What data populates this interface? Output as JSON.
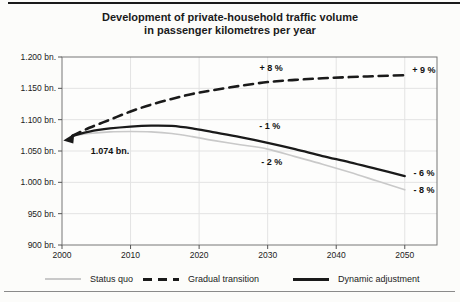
{
  "chart": {
    "title_line1": "Development of private-household traffic volume",
    "title_line2": "in passenger kilometres per year"
  },
  "chart_data": {
    "type": "line",
    "title": "Development of private-household traffic volume in passenger kilometres per year",
    "xlabel": "",
    "ylabel": "",
    "xlim": [
      2000,
      2054.7
    ],
    "ylim": [
      900,
      1200
    ],
    "grid": true,
    "legend_position": "bottom",
    "x_ticks": [
      2000,
      2010,
      2020,
      2030,
      2040,
      2050
    ],
    "x_tick_labels": [
      "2000",
      "2010",
      "2020",
      "2030",
      "2040",
      "2050"
    ],
    "y_ticks": [
      900,
      950,
      1000,
      1050,
      1100,
      1150,
      1200
    ],
    "y_tick_labels": [
      "900 bn.",
      "950 bn.",
      "1.000 bn.",
      "1.050 bn.",
      "1.100 bn.",
      "1.150 bn.",
      "1.200 bn."
    ],
    "colors": {
      "status_quo": "#c9c9c9",
      "gradual_transition": "#1a1a1a",
      "dynamic_adjustment": "#1a1a1a",
      "gridline": "#e3e3e3",
      "plot_border": "#777777"
    },
    "series": [
      {
        "name": "Status quo",
        "key": "status-quo",
        "color": "#c9c9c9",
        "width": 1.6,
        "dash": "",
        "points": [
          [
            2001.5,
            1074
          ],
          [
            2004,
            1078
          ],
          [
            2007,
            1080.5
          ],
          [
            2010,
            1081
          ],
          [
            2013,
            1080.5
          ],
          [
            2016,
            1078
          ],
          [
            2019,
            1073
          ],
          [
            2022,
            1067
          ],
          [
            2026,
            1060
          ],
          [
            2030,
            1053
          ],
          [
            2034,
            1041
          ],
          [
            2038,
            1029
          ],
          [
            2042,
            1016
          ],
          [
            2046,
            1002
          ],
          [
            2050,
            988
          ]
        ]
      },
      {
        "name": "Gradual transition",
        "key": "gradual-transition",
        "color": "#1a1a1a",
        "width": 2.6,
        "dash": "9 6",
        "points": [
          [
            2001.5,
            1074
          ],
          [
            2004,
            1087
          ],
          [
            2007,
            1100
          ],
          [
            2010,
            1113
          ],
          [
            2013,
            1124
          ],
          [
            2016,
            1133
          ],
          [
            2019,
            1141
          ],
          [
            2022,
            1147
          ],
          [
            2026,
            1154
          ],
          [
            2030,
            1160
          ],
          [
            2034,
            1163.5
          ],
          [
            2038,
            1166
          ],
          [
            2042,
            1168
          ],
          [
            2046,
            1169.5
          ],
          [
            2050,
            1171
          ]
        ]
      },
      {
        "name": "Dynamic adjustment",
        "key": "dynamic-adjustment",
        "color": "#1a1a1a",
        "width": 2.3,
        "dash": "",
        "points": [
          [
            2001.5,
            1074
          ],
          [
            2004,
            1081
          ],
          [
            2007,
            1086
          ],
          [
            2010,
            1089
          ],
          [
            2013,
            1090.5
          ],
          [
            2016,
            1090
          ],
          [
            2019,
            1086
          ],
          [
            2022,
            1080
          ],
          [
            2026,
            1072
          ],
          [
            2030,
            1063
          ],
          [
            2034,
            1053
          ],
          [
            2038,
            1042
          ],
          [
            2042,
            1032
          ],
          [
            2046,
            1021
          ],
          [
            2050,
            1010
          ]
        ]
      }
    ],
    "annotations": [
      {
        "text": "1.074 bn.",
        "year": 2007.0,
        "value": 1050
      },
      {
        "text": "+ 8 %",
        "year": 2030.5,
        "value": 1182
      },
      {
        "text": "+ 9 %",
        "year": 2052.8,
        "value": 1179
      },
      {
        "text": "- 1 %",
        "year": 2030.3,
        "value": 1090
      },
      {
        "text": "- 2 %",
        "year": 2030.6,
        "value": 1032
      },
      {
        "text": "- 6 %",
        "year": 2052.8,
        "value": 1015
      },
      {
        "text": "- 8 %",
        "year": 2052.8,
        "value": 988
      }
    ],
    "start_point": {
      "year": 2001.5,
      "value": 1074,
      "label": "1.074 bn."
    },
    "legend": [
      {
        "label": "Status quo",
        "style": "thin-gray"
      },
      {
        "label": "Gradual transition",
        "style": "dashed-black"
      },
      {
        "label": "Dynamic adjustment",
        "style": "solid-black"
      }
    ]
  }
}
